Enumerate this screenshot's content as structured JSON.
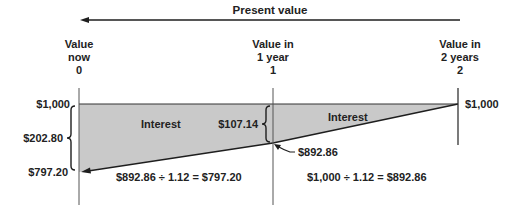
{
  "title": "Present value",
  "timeline": [
    {
      "line1": "Value",
      "line2": "now",
      "period": "0"
    },
    {
      "line1": "Value in",
      "line2": "1 year",
      "period": "1"
    },
    {
      "line1": "Value in",
      "line2": "2 years",
      "period": "2"
    }
  ],
  "values": {
    "future_value_left": "$1,000",
    "future_value_right": "$1,000",
    "total_interest": "$202.80",
    "present_value_now": "$797.20",
    "interest_year2": "$107.14",
    "value_year1": "$892.86"
  },
  "region_labels": {
    "interest_left": "Interest",
    "interest_right": "Interest"
  },
  "formulas": {
    "period1": "$892.86 ÷ 1.12 = $797.20",
    "period2": "$1,000 ÷ 1.12 = $892.86"
  },
  "colors": {
    "fill": "#c9c9c9",
    "line": "#1e1e1e",
    "axis": "#555555"
  }
}
